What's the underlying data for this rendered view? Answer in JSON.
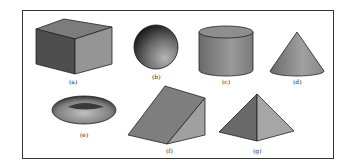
{
  "figure": {
    "shapes": [
      {
        "id": "a",
        "label": "(a)",
        "name": "cube"
      },
      {
        "id": "b",
        "label": "(b)",
        "name": "sphere"
      },
      {
        "id": "c",
        "label": "(c)",
        "name": "cylinder"
      },
      {
        "id": "d",
        "label": "(d)",
        "name": "cone"
      },
      {
        "id": "e",
        "label": "(e)",
        "name": "torus"
      },
      {
        "id": "f",
        "label": "(f)",
        "name": "wedge"
      },
      {
        "id": "g",
        "label": "(g)",
        "name": "pyramid"
      }
    ]
  },
  "colors": {
    "dark": "#5a5a5a",
    "mid": "#888888",
    "light": "#a8a8a8",
    "outline": "#222222"
  }
}
